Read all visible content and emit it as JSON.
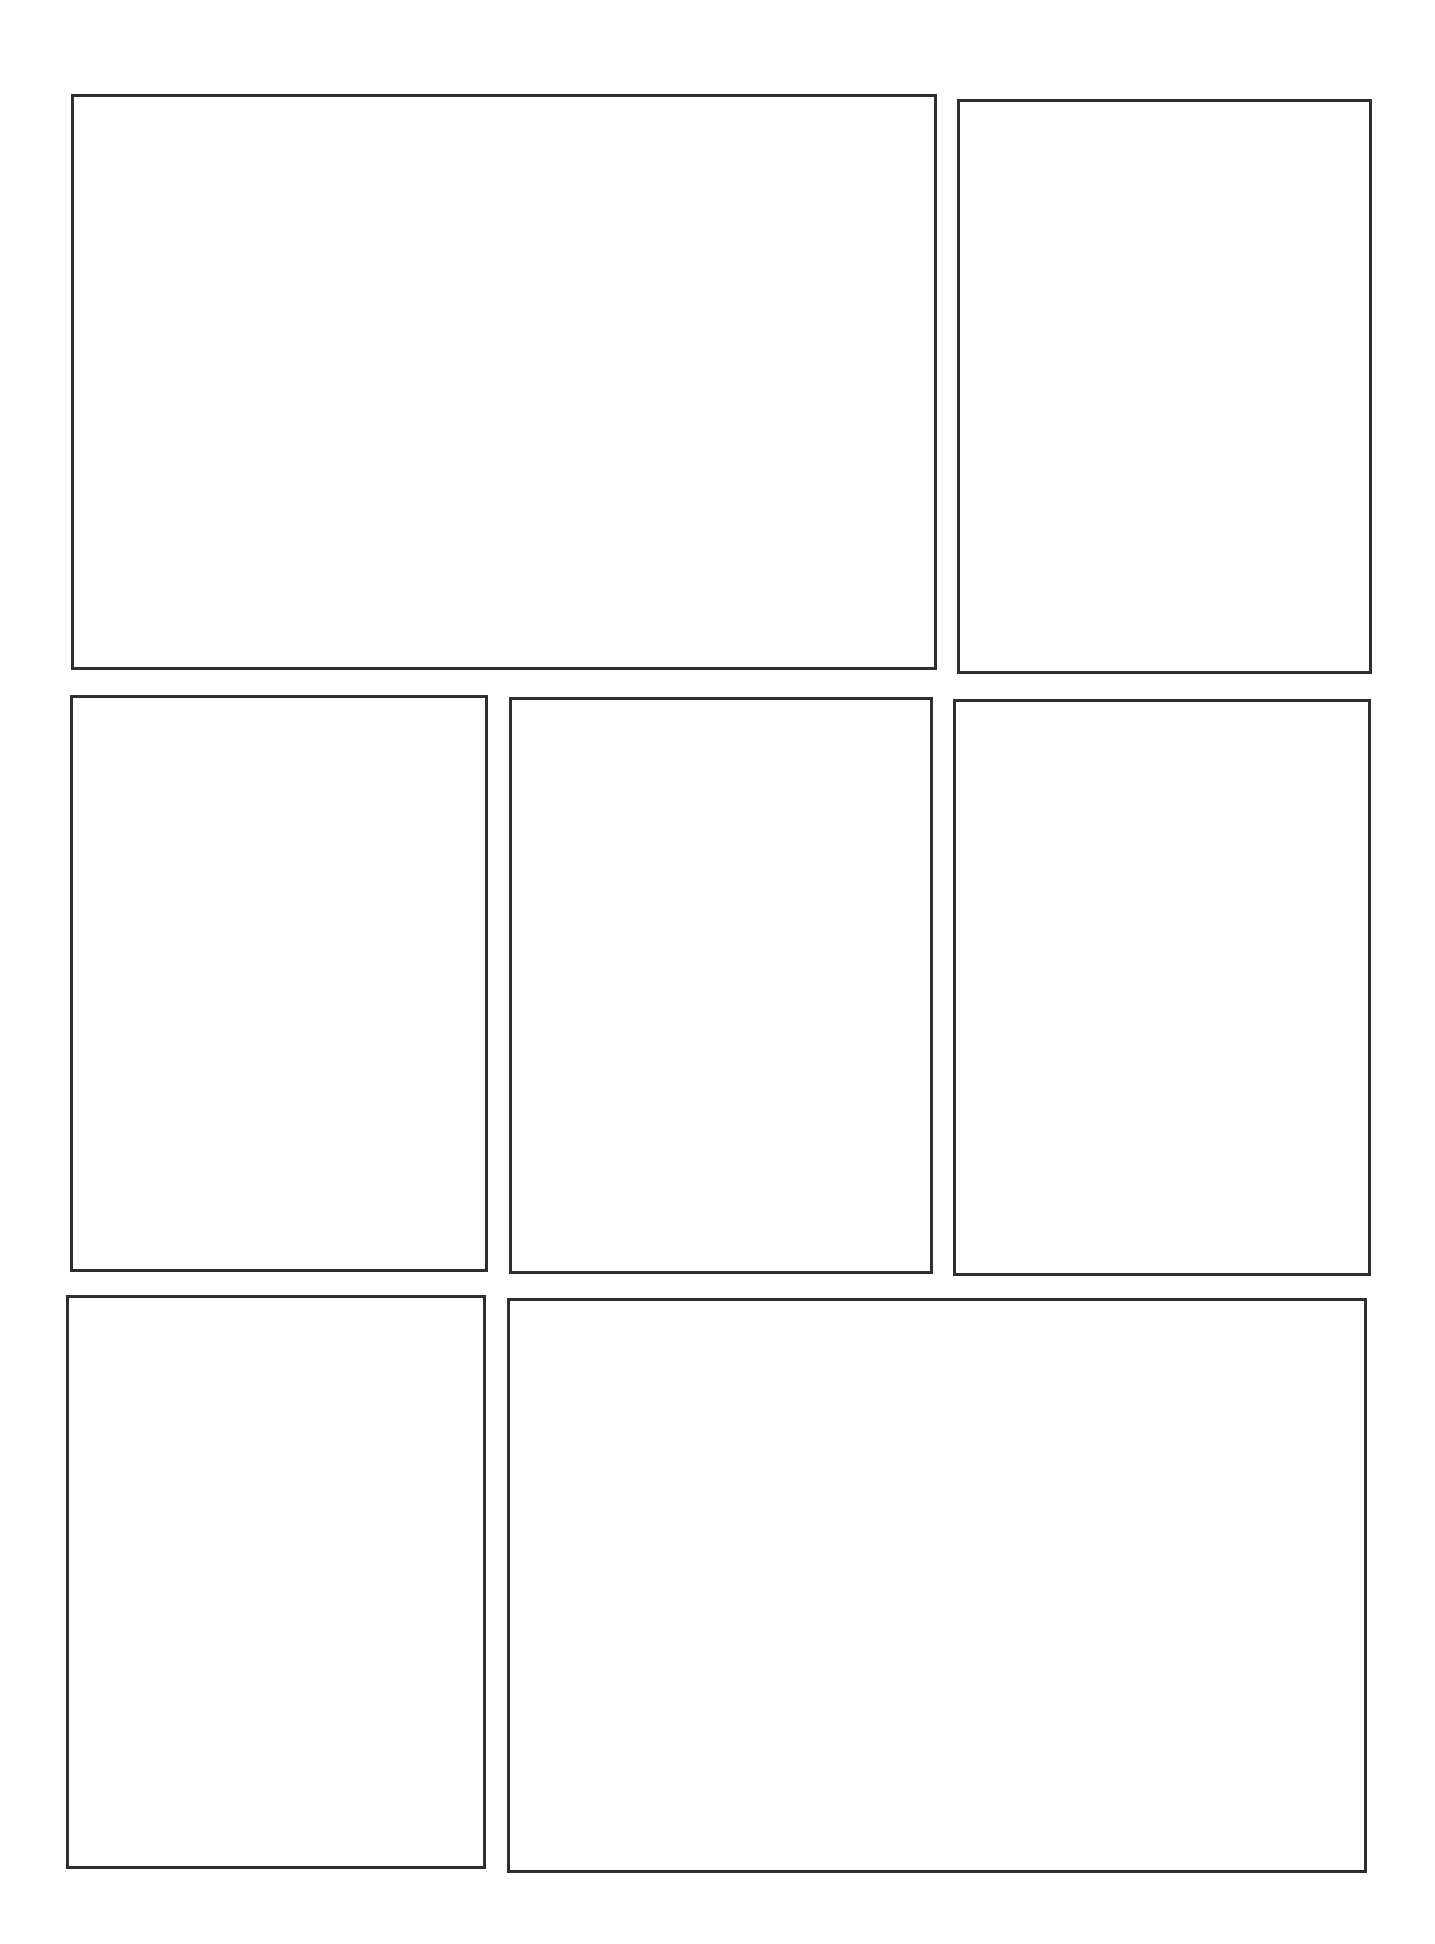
{
  "page": {
    "type": "blank comic panel layout template",
    "background_color": "#ffffff",
    "border_color": "#2e2e2e",
    "rows": 3
  },
  "panels": [
    {
      "id": "panel-1",
      "row": 1,
      "label": "",
      "x": 71,
      "y": 94,
      "w": 866,
      "h": 576
    },
    {
      "id": "panel-2",
      "row": 1,
      "label": "",
      "x": 957,
      "y": 99,
      "w": 415,
      "h": 575
    },
    {
      "id": "panel-3",
      "row": 2,
      "label": "",
      "x": 70,
      "y": 695,
      "w": 418,
      "h": 577
    },
    {
      "id": "panel-4",
      "row": 2,
      "label": "",
      "x": 509,
      "y": 697,
      "w": 424,
      "h": 577
    },
    {
      "id": "panel-5",
      "row": 2,
      "label": "",
      "x": 953,
      "y": 699,
      "w": 418,
      "h": 577
    },
    {
      "id": "panel-6",
      "row": 3,
      "label": "",
      "x": 66,
      "y": 1295,
      "w": 420,
      "h": 574
    },
    {
      "id": "panel-7",
      "row": 3,
      "label": "",
      "x": 507,
      "y": 1298,
      "w": 860,
      "h": 575
    }
  ]
}
